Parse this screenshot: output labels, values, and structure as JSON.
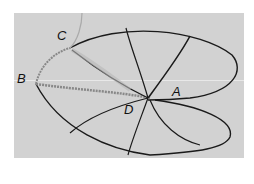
{
  "figure": {
    "labels": {
      "A": "A",
      "B": "B",
      "C": "C",
      "D": "D"
    },
    "colors": {
      "background": "#d2d2d2",
      "lines": "#1a1a1a",
      "page": "#ffffff"
    }
  }
}
